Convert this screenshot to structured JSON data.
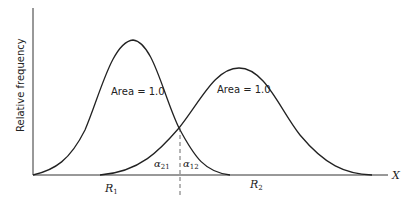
{
  "diagram": {
    "y_axis_label": "Relative frequency",
    "x_axis_label": "X",
    "curve1": {
      "area_label": "Area = 1.0",
      "region_label": "R",
      "region_sub": "1"
    },
    "curve2": {
      "area_label": "Area = 1.0",
      "region_label": "R",
      "region_sub": "2"
    },
    "alpha_left": {
      "symbol": "α",
      "sub": "21"
    },
    "alpha_right": {
      "symbol": "α",
      "sub": "12"
    }
  }
}
